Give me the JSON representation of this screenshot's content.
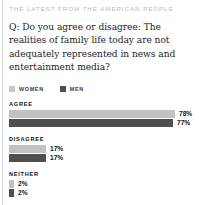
{
  "kicker": "THE LATEST FROM THE AMERICAN PEOPLE",
  "question": "Q: Do you agree or disagree: The realities of family life today are not adequately represented in news and entertainment media?",
  "legend": {
    "items": [
      {
        "label": "WOMEN",
        "color": "#c6c6c6",
        "swatch_name": "legend-swatch-women"
      },
      {
        "label": "MEN",
        "color": "#4f4f4f",
        "swatch_name": "legend-swatch-men"
      }
    ]
  },
  "chart_data": {
    "type": "bar",
    "title": "Q: Do you agree or disagree: The realities of family life today are not adequately represented in news and entertainment media?",
    "orientation": "horizontal",
    "categories": [
      "AGREE",
      "DISAGREE",
      "NEITHER"
    ],
    "series": [
      {
        "name": "WOMEN",
        "color": "#c2c2c2",
        "values": [
          78,
          17,
          2
        ]
      },
      {
        "name": "MEN",
        "color": "#4f4f4f",
        "values": [
          77,
          17,
          2
        ]
      }
    ],
    "value_labels": {
      "AGREE": [
        "78%",
        "77%"
      ],
      "DISAGREE": [
        "17%",
        "17%"
      ],
      "NEITHER": [
        "2%",
        "2%"
      ]
    },
    "unit": "%",
    "xlabel": "",
    "ylabel": "",
    "xlim": [
      0,
      100
    ],
    "grid": false,
    "legend_position": "top"
  },
  "groups": [
    {
      "label": "AGREE",
      "bars": [
        {
          "series": "WOMEN",
          "value": 78,
          "value_label": "78%",
          "width_px": 166
        },
        {
          "series": "MEN",
          "value": 77,
          "value_label": "77%",
          "width_px": 164
        }
      ]
    },
    {
      "label": "DISAGREE",
      "bars": [
        {
          "series": "WOMEN",
          "value": 17,
          "value_label": "17%",
          "width_px": 37
        },
        {
          "series": "MEN",
          "value": 17,
          "value_label": "17%",
          "width_px": 37
        }
      ]
    },
    {
      "label": "NEITHER",
      "bars": [
        {
          "series": "WOMEN",
          "value": 2,
          "value_label": "2%",
          "width_px": 5
        },
        {
          "series": "MEN",
          "value": 2,
          "value_label": "2%",
          "width_px": 5
        }
      ]
    }
  ]
}
